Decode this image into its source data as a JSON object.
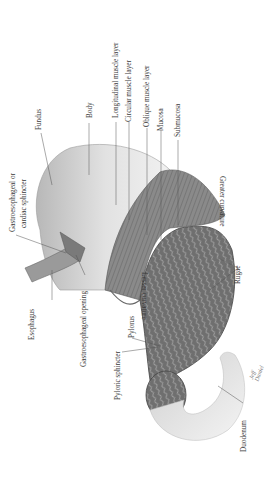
{
  "diagram": {
    "orientation": "rotated 90° counter-clockwise",
    "labels": {
      "fundus": "Fundus",
      "body": "Body",
      "longitudinal_muscle_layer": "Longitudinal muscle layer",
      "circular_muscle_layer": "Circular muscle layer",
      "oblique_muscle_layer": "Oblique muscle layer",
      "mucosa": "Mucosa",
      "submucosa": "Submucosa",
      "gastroesophageal_sphincter_line1": "Gastroesophageal or",
      "gastroesophageal_sphincter_line2": "cardiac sphincter",
      "greater_curvature": "Greater curvature",
      "esophagus": "Esophagus",
      "gastroesophageal_opening": "Gastroesophageal opening",
      "rugae": "Rugae",
      "lesser_curvature": "Lesser curvature",
      "pylorus": "Pylorus",
      "pyloric_sphincter": "Pyloric sphincter",
      "duodenum": "Duodenum"
    },
    "signature": "Jeff Daniel",
    "colors": {
      "outer_surface": "#dcdcdc",
      "muscle": "#8c8c8c",
      "mucosa": "#6e6e6e",
      "leader_line": "#555555",
      "text": "#3a3a3a"
    }
  }
}
